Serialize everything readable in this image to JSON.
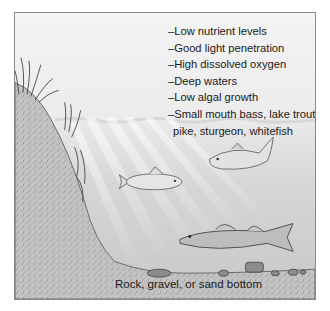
{
  "diagram": {
    "features": [
      "–Low nutrient levels",
      "–Good light penetration",
      "–High dissolved oxygen",
      "–Deep waters",
      "–Low algal growth",
      "–Small mouth bass, lake trout,",
      "pike, sturgeon, whitefish"
    ],
    "bottom_label": "Rock, gravel, or sand bottom",
    "elements": {
      "shore": "sandy-slope",
      "plants": "aquatic-grass",
      "light": "sun-rays",
      "fish": [
        "whitefish",
        "lake-trout",
        "walleye-pike"
      ],
      "rocks": "bottom-rocks"
    },
    "colors": {
      "water_top": "#f4f4f4",
      "water_bottom": "#c8c8c8",
      "sand": "#bdbdbd",
      "outline": "#555555"
    }
  }
}
